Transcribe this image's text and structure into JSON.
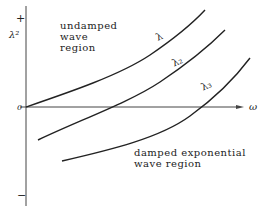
{
  "diagram": {
    "y_axis": {
      "symbol": "λ²",
      "plus": "+",
      "minus": "−",
      "zero": "0"
    },
    "x_axis": {
      "symbol": "ω"
    },
    "curves": [
      {
        "label": "λ",
        "path": "M26,107 C70,92 120,75 150,55 C175,38 192,24 205,10"
      },
      {
        "label": "λ₂",
        "path": "M38,140 C80,120 130,102 160,82 C190,62 210,45 225,30"
      },
      {
        "label": "λ₃",
        "path": "M62,161 C110,150 160,138 190,116 C215,98 235,78 250,58"
      }
    ],
    "regions": {
      "upper": [
        "undamped",
        "wave",
        "region"
      ],
      "lower": [
        "damped exponential",
        "wave region"
      ]
    },
    "colors": {
      "line": "#222222",
      "axis": "#444444",
      "background": "#ffffff"
    }
  }
}
